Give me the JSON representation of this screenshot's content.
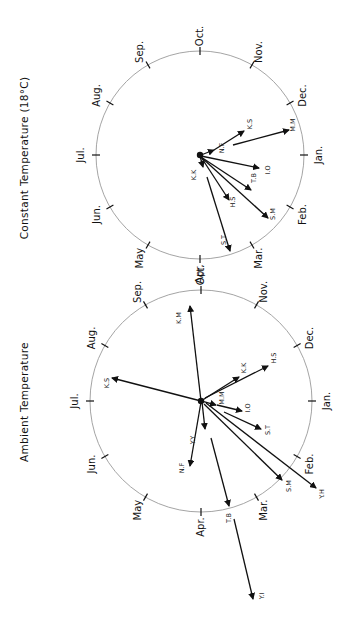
{
  "panels": [
    {
      "id": "constant",
      "title": "Constant  Temperature (18°C)",
      "center": [
        200,
        155
      ],
      "radius": 104,
      "title_pos": [
        25,
        158
      ],
      "months": [
        {
          "label": "Oct.",
          "angle": 0
        },
        {
          "label": "Nov.",
          "angle": 30
        },
        {
          "label": "Dec.",
          "angle": 60
        },
        {
          "label": "Jan.",
          "angle": 90
        },
        {
          "label": "Feb.",
          "angle": 120
        },
        {
          "label": "Mar.",
          "angle": 150
        },
        {
          "label": "Apr.",
          "angle": 180
        },
        {
          "label": "May",
          "angle": 210
        },
        {
          "label": "Jun.",
          "angle": 240
        },
        {
          "label": "Jul.",
          "angle": 270
        },
        {
          "label": "Aug.",
          "angle": 300
        },
        {
          "label": "Sep.",
          "angle": 330
        }
      ],
      "arrows": [
        {
          "label": "N.F",
          "from": [
            201,
            155
          ],
          "to": [
            214,
            150
          ],
          "label_pos": [
            222,
            148
          ]
        },
        {
          "label": "K.S",
          "from": [
            214,
            150
          ],
          "to": [
            244,
            131
          ],
          "label_pos": [
            250,
            124
          ]
        },
        {
          "label": "M.M",
          "from": [
            233,
            145
          ],
          "to": [
            289,
            130
          ],
          "label_pos": [
            293,
            125
          ]
        },
        {
          "label": "I.O",
          "from": [
            201,
            156
          ],
          "to": [
            259,
            168
          ],
          "label_pos": [
            268,
            170
          ]
        },
        {
          "label": "T.B",
          "from": [
            201,
            157
          ],
          "to": [
            251,
            190
          ],
          "label_pos": [
            254,
            178
          ]
        },
        {
          "label": "S.M",
          "from": [
            201,
            157
          ],
          "to": [
            268,
            218
          ],
          "label_pos": [
            273,
            214
          ]
        },
        {
          "label": "H.S",
          "from": [
            201,
            157
          ],
          "to": [
            229,
            200
          ],
          "label_pos": [
            233,
            202
          ]
        },
        {
          "label": "K.K",
          "from": [
            200,
            156
          ],
          "to": [
            203,
            167
          ],
          "label_pos": [
            194,
            175
          ]
        },
        {
          "label": "S.T",
          "from": [
            207,
            177
          ],
          "to": [
            230,
            251
          ],
          "label_pos": [
            224,
            240
          ]
        }
      ]
    },
    {
      "id": "ambient",
      "title": "Ambient  Temperature",
      "center": [
        201,
        401
      ],
      "radius": 111,
      "title_pos": [
        25,
        402
      ],
      "months": [
        {
          "label": "Oct.",
          "angle": 0
        },
        {
          "label": "Nov.",
          "angle": 30
        },
        {
          "label": "Dec.",
          "angle": 60
        },
        {
          "label": "Jan.",
          "angle": 90
        },
        {
          "label": "Feb.",
          "angle": 120
        },
        {
          "label": "Mar.",
          "angle": 150
        },
        {
          "label": "Apr.",
          "angle": 180
        },
        {
          "label": "May",
          "angle": 210
        },
        {
          "label": "Jun.",
          "angle": 240
        },
        {
          "label": "Jul.",
          "angle": 270
        },
        {
          "label": "Aug.",
          "angle": 300
        },
        {
          "label": "Sep.",
          "angle": 330
        }
      ],
      "arrows": [
        {
          "label": "K.M",
          "from": [
            201,
            401
          ],
          "to": [
            190,
            306
          ],
          "label_pos": [
            179,
            318
          ]
        },
        {
          "label": "K.S",
          "from": [
            201,
            401
          ],
          "to": [
            112,
            378
          ],
          "label_pos": [
            107,
            383
          ]
        },
        {
          "label": "K.K",
          "from": [
            201,
            401
          ],
          "to": [
            239,
            377
          ],
          "label_pos": [
            244,
            368
          ]
        },
        {
          "label": "H.S",
          "from": [
            205,
            398
          ],
          "to": [
            268,
            366
          ],
          "label_pos": [
            274,
            358
          ]
        },
        {
          "label": "M.M",
          "from": [
            202,
            401
          ],
          "to": [
            216,
            405
          ],
          "label_pos": [
            222,
            398
          ]
        },
        {
          "label": "I.O",
          "from": [
            217,
            405
          ],
          "to": [
            242,
            411
          ],
          "label_pos": [
            248,
            408
          ]
        },
        {
          "label": "S.T",
          "from": [
            224,
            412
          ],
          "to": [
            261,
            429
          ],
          "label_pos": [
            268,
            430
          ]
        },
        {
          "label": "Y.Y",
          "from": [
            202,
            402
          ],
          "to": [
            205,
            429
          ],
          "label_pos": [
            193,
            440
          ]
        },
        {
          "label": "N.F",
          "from": [
            201,
            402
          ],
          "to": [
            190,
            466
          ],
          "label_pos": [
            182,
            468
          ]
        },
        {
          "label": "T.B",
          "from": [
            211,
            438
          ],
          "to": [
            229,
            506
          ],
          "label_pos": [
            229,
            518
          ]
        },
        {
          "label": "S.M",
          "from": [
            204,
            404
          ],
          "to": [
            282,
            480
          ],
          "label_pos": [
            289,
            486
          ]
        },
        {
          "label": "Y.H",
          "from": [
            206,
            403
          ],
          "to": [
            316,
            488
          ],
          "label_pos": [
            322,
            494
          ]
        },
        {
          "label": "Y.I",
          "from": [
            234,
            519
          ],
          "to": [
            253,
            599
          ],
          "label_pos": [
            262,
            596
          ]
        }
      ]
    }
  ]
}
